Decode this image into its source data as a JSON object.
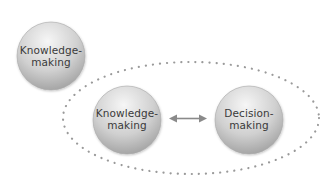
{
  "diagram": {
    "outer_node": {
      "line1": "Knowledge-",
      "line2": "making"
    },
    "group": {
      "left_node": {
        "line1": "Knowledge-",
        "line2": "making"
      },
      "right_node": {
        "line1": "Decision-",
        "line2": "making"
      },
      "connector": "bidirectional-arrow"
    },
    "colors": {
      "node_light": "#f2f2f2",
      "node_dark": "#9a9a9a",
      "text": "#3a3a3a",
      "dots": "#9a9a9a",
      "arrow": "#8a8a8a"
    }
  }
}
